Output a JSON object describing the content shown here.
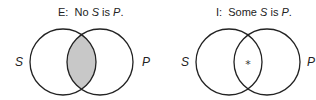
{
  "diagrams": [
    {
      "id": "E",
      "title_prefix": "E:",
      "title_parts": [
        "No ",
        "S",
        " is ",
        "P",
        "."
      ],
      "left_label": "S",
      "right_label": "P",
      "intersection": "shaded",
      "shade_color": "#c8c8c8"
    },
    {
      "id": "I",
      "title_prefix": "I:",
      "title_parts": [
        "Some ",
        "S",
        " is ",
        "P",
        "."
      ],
      "left_label": "S",
      "right_label": "P",
      "intersection": "asterisk",
      "marker": "*"
    }
  ]
}
